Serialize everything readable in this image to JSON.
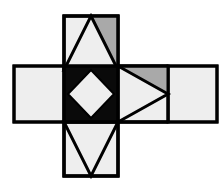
{
  "figure": {
    "name": "cube-net-diagram",
    "canvas": {
      "width": 223,
      "height": 185,
      "background": "#ffffff"
    },
    "colors": {
      "stroke": "#000000",
      "light_gray": "#eeeeee",
      "mid_gray": "#a9a9a9",
      "black": "#0a0a0a",
      "white": "#ffffff"
    },
    "stroke_width": 3,
    "grid": {
      "left": 14,
      "mid_left": 64,
      "mid_right": 118,
      "right": 217,
      "top": 16,
      "mid_top": 66,
      "mid_bottom": 122,
      "bottom": 176
    },
    "faces": [
      {
        "id": "top-face",
        "label": "Top square with upward triangle",
        "fill": "#eeeeee",
        "rect": [
          64,
          16,
          54,
          54
        ],
        "shapes": [
          {
            "id": "top-face-gray-wedge",
            "label": "gray corner wedge",
            "fill": "#a9a9a9",
            "points": "91,16 118,16 118,70"
          },
          {
            "id": "top-face-triangle",
            "label": "upward triangle",
            "fill": "#eeeeee",
            "points": "91,16 118,70 64,70"
          }
        ]
      },
      {
        "id": "left-face",
        "label": "Left square plain",
        "fill": "#eeeeee",
        "rect": [
          14,
          66,
          50,
          56
        ],
        "shapes": []
      },
      {
        "id": "center-face",
        "label": "Center black square with light diamond",
        "fill": "#0a0a0a",
        "rect": [
          64,
          66,
          54,
          56
        ],
        "shapes": [
          {
            "id": "center-face-diamond",
            "label": "inscribed diamond",
            "fill": "#eeeeee",
            "points": "91,70 114,94 91,118 68,94"
          }
        ]
      },
      {
        "id": "right-face",
        "label": "Right square with rightward triangle",
        "fill": "#eeeeee",
        "rect": [
          118,
          66,
          50,
          56
        ],
        "shapes": [
          {
            "id": "right-face-gray-wedge",
            "label": "gray corner wedge",
            "fill": "#a9a9a9",
            "points": "118,66 168,66 168,94"
          },
          {
            "id": "right-face-triangle",
            "label": "rightward triangle",
            "fill": "#eeeeee",
            "points": "118,66 168,94 118,122"
          }
        ]
      },
      {
        "id": "far-right-face",
        "label": "Far right square plain",
        "fill": "#eeeeee",
        "rect": [
          168,
          66,
          49,
          56
        ],
        "shapes": []
      },
      {
        "id": "bottom-face",
        "label": "Bottom square with downward triangle",
        "fill": "#eeeeee",
        "rect": [
          64,
          122,
          54,
          54
        ],
        "shapes": [
          {
            "id": "bottom-face-triangle",
            "label": "downward V triangle",
            "fill": "#eeeeee",
            "points": "64,122 118,122 91,176"
          }
        ]
      }
    ]
  }
}
